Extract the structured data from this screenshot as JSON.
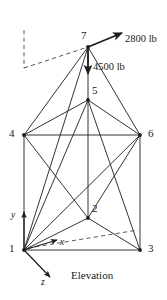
{
  "figure": {
    "name": "space-truss-elevation",
    "view_label": "Elevation",
    "stroke_color": "#1d1d1d",
    "background_color": "#ffffff"
  },
  "nodes": [
    {
      "id": "1",
      "label": "1",
      "x": 24,
      "y": 250,
      "label_x": 9,
      "label_y": 243
    },
    {
      "id": "2",
      "label": "2",
      "x": 88,
      "y": 218,
      "label_x": 92,
      "label_y": 203
    },
    {
      "id": "3",
      "label": "3",
      "x": 140,
      "y": 250,
      "label_x": 148,
      "label_y": 243
    },
    {
      "id": "4",
      "label": "4",
      "x": 24,
      "y": 135,
      "label_x": 9,
      "label_y": 128
    },
    {
      "id": "5",
      "label": "5",
      "x": 88,
      "y": 100,
      "label_x": 92,
      "label_y": 85
    },
    {
      "id": "6",
      "label": "6",
      "x": 140,
      "y": 135,
      "label_x": 148,
      "label_y": 128
    },
    {
      "id": "7",
      "label": "7",
      "x": 88,
      "y": 47,
      "label_x": 81,
      "label_y": 30
    }
  ],
  "members": [
    {
      "from": "1",
      "to": "3",
      "style": "solid"
    },
    {
      "from": "1",
      "to": "2",
      "style": "solid"
    },
    {
      "from": "2",
      "to": "3",
      "style": "solid"
    },
    {
      "from": "1",
      "to": "4",
      "style": "solid"
    },
    {
      "from": "3",
      "to": "6",
      "style": "solid"
    },
    {
      "from": "2",
      "to": "5",
      "style": "solid"
    },
    {
      "from": "4",
      "to": "6",
      "style": "solid"
    },
    {
      "from": "4",
      "to": "5",
      "style": "solid"
    },
    {
      "from": "5",
      "to": "6",
      "style": "solid"
    },
    {
      "from": "4",
      "to": "7",
      "style": "solid"
    },
    {
      "from": "6",
      "to": "7",
      "style": "solid"
    },
    {
      "from": "5",
      "to": "7",
      "style": "solid"
    },
    {
      "from": "1",
      "to": "5",
      "style": "solid"
    },
    {
      "from": "3",
      "to": "5",
      "style": "solid"
    },
    {
      "from": "1",
      "to": "6",
      "style": "solid"
    },
    {
      "from": "1",
      "to": "7",
      "style": "solid"
    },
    {
      "from": "2",
      "to": "6",
      "style": "solid"
    },
    {
      "from": "2",
      "to": "4",
      "style": "solid"
    }
  ],
  "hidden_lines": [
    {
      "name": "dimension-vertical-dashed",
      "x1": 24,
      "y1": 30,
      "x2": 24,
      "y2": 68
    },
    {
      "name": "dimension-leader-dashed",
      "x1": 24,
      "y1": 68,
      "x2": 88,
      "y2": 47
    },
    {
      "name": "hidden-edge-1-6-dashed",
      "x1": 28,
      "y1": 248,
      "x2": 138,
      "y2": 230
    }
  ],
  "loads": [
    {
      "name": "load-2800",
      "label": "2800 lb",
      "magnitude": 2800,
      "units": "lb",
      "from_node": "7",
      "tip_x": 122,
      "tip_y": 33,
      "label_x": 125,
      "label_y": 34
    },
    {
      "name": "load-4500",
      "label": "4500 lb",
      "magnitude": 4500,
      "units": "lb",
      "from_node": "7",
      "tip_x": 88,
      "tip_y": 74,
      "label_x": 93,
      "label_y": 62
    }
  ],
  "axes": [
    {
      "name": "axis-y",
      "label": "y",
      "x1": 24,
      "y1": 250,
      "x2": 24,
      "y2": 212,
      "label_x": 11,
      "label_y": 211
    },
    {
      "name": "axis-x",
      "label": "x",
      "x1": 24,
      "y1": 250,
      "x2": 57,
      "y2": 240,
      "label_x": 60,
      "label_y": 238
    },
    {
      "name": "axis-z",
      "label": "z",
      "x1": 24,
      "y1": 250,
      "x2": 50,
      "y2": 277,
      "label_x": 41,
      "label_y": 278
    }
  ],
  "view": {
    "label": "Elevation",
    "label_x": 71,
    "label_y": 270
  }
}
